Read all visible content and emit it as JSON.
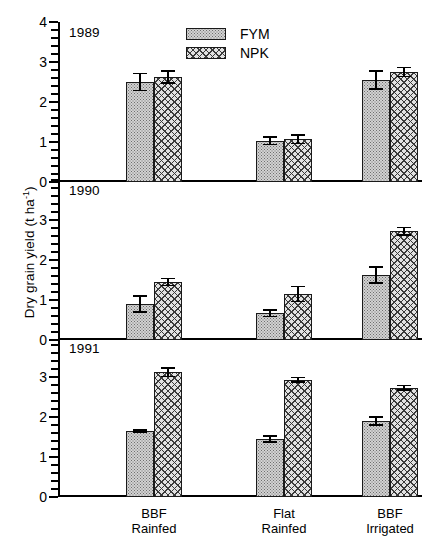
{
  "chart_data": {
    "type": "bar",
    "title": "",
    "xlabel": "",
    "ylabel": "Dry grain yield (t ha",
    "ylabel_sup": "-1",
    "ylabel_close": ")",
    "categories": [
      "BBF Rainfed",
      "Flat Rainfed",
      "BBF Irrigated"
    ],
    "category_lines": [
      [
        "BBF",
        "Rainfed"
      ],
      [
        "Flat",
        "Rainfed"
      ],
      [
        "BBF",
        "Irrigated"
      ]
    ],
    "legend": {
      "position": "top-center",
      "entries": [
        {
          "name": "FYM",
          "pattern": "stipple"
        },
        {
          "name": "NPK",
          "pattern": "crosshatch"
        }
      ]
    },
    "grid": false,
    "axis": {
      "ylim": [
        0,
        4
      ],
      "major_tick_step": 1,
      "minor_tick_step": 0.2
    },
    "panels": [
      {
        "label": "1989",
        "ytick_labels": [
          "0",
          "1",
          "2",
          "3",
          "4"
        ],
        "ytick_values": [
          0,
          1,
          2,
          3,
          4
        ],
        "ylim": [
          0,
          4
        ],
        "series": [
          {
            "name": "FYM",
            "values": [
              2.5,
              1.03,
              2.55
            ],
            "errors": [
              0.23,
              0.11,
              0.25
            ]
          },
          {
            "name": "NPK",
            "values": [
              2.62,
              1.07,
              2.75
            ],
            "errors": [
              0.17,
              0.13,
              0.13
            ]
          }
        ]
      },
      {
        "label": "1990",
        "ytick_labels": [
          "0",
          "1",
          "2",
          "3"
        ],
        "ytick_values": [
          0,
          1,
          2,
          3
        ],
        "ylim": [
          0,
          4
        ],
        "series": [
          {
            "name": "FYM",
            "values": [
              0.9,
              0.67,
              1.63
            ],
            "errors": [
              0.22,
              0.1,
              0.22
            ]
          },
          {
            "name": "NPK",
            "values": [
              1.45,
              1.15,
              2.72
            ],
            "errors": [
              0.11,
              0.21,
              0.11
            ]
          }
        ]
      },
      {
        "label": "1991",
        "ytick_labels": [
          "0",
          "1",
          "2",
          "3"
        ],
        "ytick_values": [
          0,
          1,
          2,
          3
        ],
        "ylim": [
          0,
          4
        ],
        "series": [
          {
            "name": "FYM",
            "values": [
              1.65,
              1.45,
              1.9
            ],
            "errors": [
              0.05,
              0.09,
              0.12
            ]
          },
          {
            "name": "NPK",
            "values": [
              3.12,
              2.93,
              2.73
            ],
            "errors": [
              0.13,
              0.08,
              0.08
            ]
          }
        ]
      }
    ]
  }
}
